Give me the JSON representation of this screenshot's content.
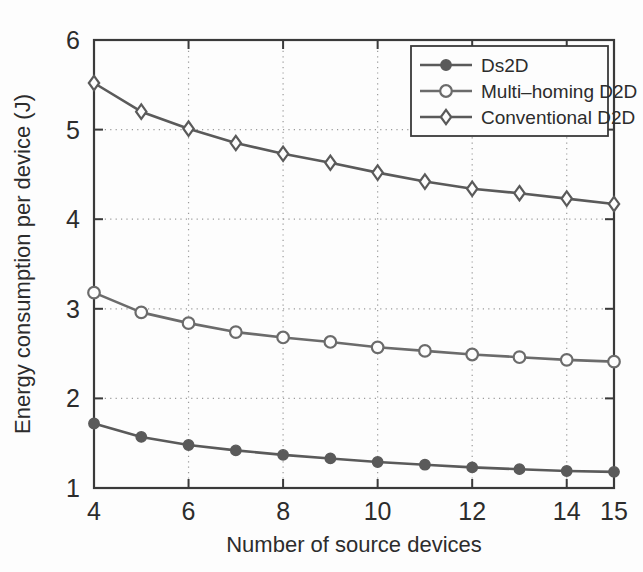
{
  "chart_data": {
    "type": "line",
    "title": "",
    "xlabel": "Number of source devices",
    "ylabel": "Energy consumption per device (J)",
    "x": [
      4,
      5,
      6,
      7,
      8,
      9,
      10,
      11,
      12,
      13,
      14,
      15
    ],
    "xlim": [
      4,
      15
    ],
    "ylim": [
      1,
      6
    ],
    "xticks": [
      4,
      6,
      8,
      10,
      12,
      14,
      15
    ],
    "xticklabels": [
      "4",
      "6",
      "8",
      "10",
      "12",
      "14",
      "15"
    ],
    "yticks": [
      1,
      2,
      3,
      4,
      5,
      6
    ],
    "yticklabels": [
      "1",
      "2",
      "3",
      "4",
      "5",
      "6"
    ],
    "grid": true,
    "grid_style": "dotted",
    "legend_position": "upper right",
    "series": [
      {
        "name": "Ds2D",
        "marker": "filled-circle",
        "color": "#5a5a5a",
        "values": [
          1.72,
          1.57,
          1.48,
          1.42,
          1.37,
          1.33,
          1.29,
          1.26,
          1.23,
          1.21,
          1.19,
          1.18
        ]
      },
      {
        "name": "Multi–homing D2D",
        "marker": "open-circle",
        "color": "#6b6b6b",
        "values": [
          3.18,
          2.96,
          2.84,
          2.74,
          2.68,
          2.63,
          2.57,
          2.53,
          2.49,
          2.46,
          2.43,
          2.41
        ]
      },
      {
        "name": "Conventional D2D",
        "marker": "open-diamond",
        "color": "#5a5a5a",
        "values": [
          5.52,
          5.2,
          5.01,
          4.85,
          4.73,
          4.63,
          4.52,
          4.42,
          4.34,
          4.29,
          4.23,
          4.17
        ]
      }
    ]
  },
  "axis": {
    "xlabel": "Number of source devices",
    "ylabel": "Energy consumption per device (J)"
  },
  "legend": {
    "items": [
      {
        "label": "Ds2D"
      },
      {
        "label": "Multi–homing D2D"
      },
      {
        "label": "Conventional D2D"
      }
    ]
  },
  "colors": {
    "line": "#5a5a5a",
    "axis": "#3a3a3a",
    "grid": "#9a9a9a",
    "text": "#2c2c2c",
    "background": "#fdfdfd"
  }
}
